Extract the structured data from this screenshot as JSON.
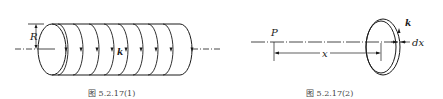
{
  "figures": [
    {
      "id": "fig1",
      "caption": "图 5.2.17(1)",
      "labels": {
        "radius": "R",
        "surface_current": "k"
      },
      "description": "Solid cylinder of radius R with azimuthal surface current density k shown by arcs with arrows; dash-dot axis along the cylinder."
    },
    {
      "id": "fig2",
      "caption": "图 5.2.17(2)",
      "labels": {
        "point": "P",
        "distance": "x",
        "surface_current": "k",
        "thickness": "dx"
      },
      "description": "Thin ring of width dx carrying current k, at distance x from point P on the axis."
    }
  ]
}
